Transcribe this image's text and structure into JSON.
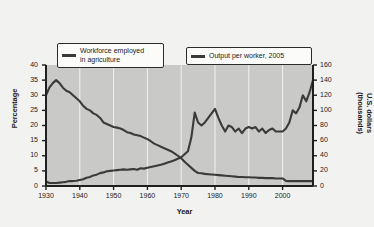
{
  "chart_data": {
    "type": "line",
    "title": "",
    "xlabel": "Year",
    "ylabel": "Percentage",
    "ylabel_right": "U.S. dollars (thousands)",
    "xlim": [
      1930,
      2009
    ],
    "ylim": [
      0,
      40
    ],
    "ylim_right": [
      0,
      160
    ],
    "grid": "vertical white gridlines at each decade",
    "legend_position": "top inside plot, two boxes",
    "xticks": [
      1930,
      1940,
      1950,
      1960,
      1970,
      1980,
      1990,
      2000
    ],
    "xtick_labels": [
      "1930",
      "1940",
      "1950",
      "1960",
      "1970",
      "1980",
      "1990",
      "2000"
    ],
    "yticks_left": [
      0,
      5,
      10,
      15,
      20,
      25,
      30,
      35,
      40
    ],
    "ytick_labels_left": [
      "0",
      "5",
      "10",
      "15",
      "20",
      "25",
      "30",
      "35",
      "40"
    ],
    "yticks_right": [
      0,
      20,
      40,
      60,
      80,
      100,
      120,
      140,
      160
    ],
    "ytick_labels_right": [
      "0",
      "20",
      "40",
      "60",
      "80",
      "100",
      "120",
      "140",
      "160"
    ],
    "series": [
      {
        "name": "Workforce employed in agriculture",
        "axis": "left",
        "units": "percent",
        "color": "#3a3a3a",
        "x": [
          1930,
          1931,
          1932,
          1933,
          1934,
          1935,
          1936,
          1937,
          1938,
          1939,
          1940,
          1941,
          1942,
          1943,
          1944,
          1945,
          1946,
          1947,
          1948,
          1949,
          1950,
          1951,
          1952,
          1953,
          1954,
          1955,
          1956,
          1957,
          1958,
          1959,
          1960,
          1961,
          1962,
          1963,
          1964,
          1965,
          1966,
          1967,
          1968,
          1969,
          1970,
          1971,
          1972,
          1973,
          1974,
          1975,
          1976,
          1977,
          1978,
          1979,
          1980,
          1981,
          1982,
          1983,
          1984,
          1985,
          1986,
          1987,
          1988,
          1989,
          1990,
          1991,
          1992,
          1993,
          1994,
          1995,
          1996,
          1997,
          1998,
          1999,
          2000,
          2001,
          2002,
          2003,
          2004,
          2005,
          2006,
          2007,
          2008,
          2009
        ],
        "values": [
          30.0,
          32.5,
          34.0,
          35.0,
          34.0,
          32.5,
          31.5,
          31.0,
          30.0,
          29.0,
          28.0,
          26.5,
          25.5,
          25.0,
          24.0,
          23.5,
          22.5,
          21.0,
          20.5,
          20.0,
          19.5,
          19.3,
          19.0,
          18.5,
          17.8,
          17.5,
          17.0,
          16.8,
          16.5,
          16.0,
          15.5,
          14.8,
          14.0,
          13.5,
          13.0,
          12.5,
          12.0,
          11.5,
          10.8,
          10.0,
          9.2,
          8.0,
          7.0,
          6.0,
          5.0,
          4.3,
          4.2,
          4.0,
          3.9,
          3.8,
          3.7,
          3.6,
          3.5,
          3.4,
          3.3,
          3.2,
          3.1,
          3.0,
          3.0,
          2.9,
          2.9,
          2.8,
          2.8,
          2.7,
          2.7,
          2.6,
          2.6,
          2.6,
          2.5,
          2.5,
          2.5,
          1.7,
          1.6,
          1.6,
          1.6,
          1.6,
          1.6,
          1.6,
          1.6,
          1.6
        ]
      },
      {
        "name": "Output per worker, 2005",
        "axis": "right",
        "units": "U.S. dollars (thousands)",
        "color": "#3a3a3a",
        "x": [
          1930,
          1931,
          1932,
          1933,
          1934,
          1935,
          1936,
          1937,
          1938,
          1939,
          1940,
          1941,
          1942,
          1943,
          1944,
          1945,
          1946,
          1947,
          1948,
          1949,
          1950,
          1951,
          1952,
          1953,
          1954,
          1955,
          1956,
          1957,
          1958,
          1959,
          1960,
          1961,
          1962,
          1963,
          1964,
          1965,
          1966,
          1967,
          1968,
          1969,
          1970,
          1971,
          1972,
          1973,
          1974,
          1975,
          1976,
          1977,
          1978,
          1979,
          1980,
          1981,
          1982,
          1983,
          1984,
          1985,
          1986,
          1987,
          1988,
          1989,
          1990,
          1991,
          1992,
          1993,
          1994,
          1995,
          1996,
          1997,
          1998,
          1999,
          2000,
          2001,
          2002,
          2003,
          2004,
          2005,
          2006,
          2007,
          2008,
          2009
        ],
        "values": [
          6.0,
          4.0,
          4.0,
          4.0,
          4.5,
          5.0,
          5.5,
          6.5,
          6.5,
          7.0,
          8.0,
          9.0,
          11.0,
          12.0,
          14.0,
          15.0,
          17.0,
          18.0,
          19.5,
          20.0,
          20.5,
          21.0,
          21.5,
          22.0,
          21.5,
          22.0,
          22.5,
          21.5,
          23.5,
          23.0,
          24.0,
          25.0,
          26.0,
          27.0,
          28.0,
          29.5,
          31.0,
          32.5,
          34.0,
          36.0,
          38.0,
          42.0,
          46.0,
          64.0,
          97.0,
          84.0,
          80.0,
          84.0,
          90.0,
          96.0,
          102.0,
          90.0,
          80.0,
          72.0,
          80.0,
          78.0,
          72.0,
          76.0,
          70.0,
          76.0,
          78.0,
          76.0,
          78.0,
          72.0,
          76.0,
          70.0,
          74.0,
          76.0,
          72.0,
          72.0,
          72.0,
          76.0,
          84.0,
          100.0,
          96.0,
          104.0,
          120.0,
          112.0,
          124.0,
          140.0
        ]
      }
    ]
  },
  "legend": {
    "workforce": "Workforce employed\nin agriculture",
    "output": "Output per worker, 2005"
  }
}
